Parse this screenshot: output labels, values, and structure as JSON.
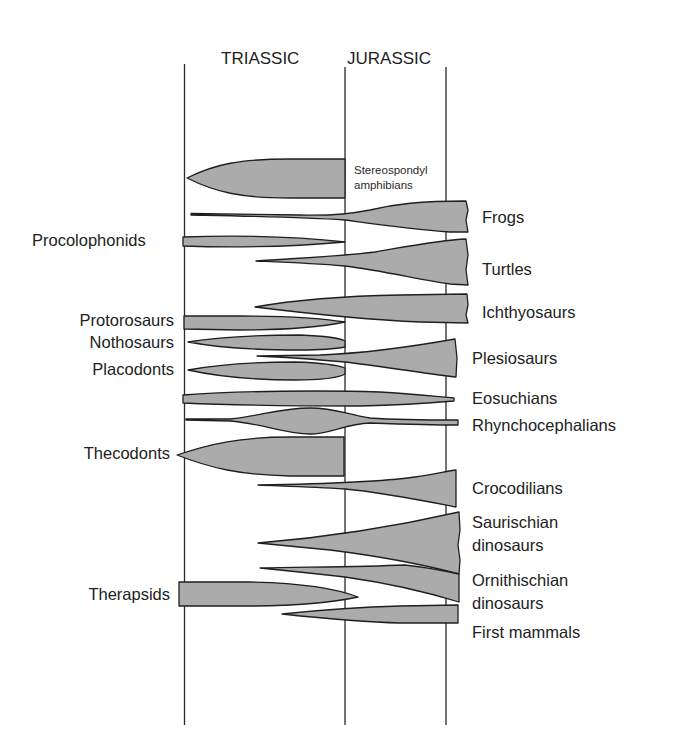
{
  "diagram": {
    "periods": [
      {
        "label": "TRIASSIC"
      },
      {
        "label": "JURASSIC"
      }
    ],
    "colors": {
      "fill": "#ababab",
      "outline": "#1f1f1f",
      "text": "#222222",
      "background": "#ffffff"
    },
    "groups": [
      {
        "name": "Stereospondyl",
        "name_line2": "amphibians",
        "side": "right",
        "range": "Triassic only (ends at Triassic/Jurassic boundary)"
      },
      {
        "name": "Frogs",
        "side": "right",
        "range": "Early Triassic (thin) expanding through Jurassic"
      },
      {
        "name": "Procolophonids",
        "side": "left",
        "range": "Triassic only"
      },
      {
        "name": "Turtles",
        "side": "right",
        "range": "Late Triassic expanding through Jurassic"
      },
      {
        "name": "Ichthyosaurs",
        "side": "right",
        "range": "Mid Triassic through Jurassic"
      },
      {
        "name": "Protorosaurs",
        "side": "left",
        "range": "Triassic only"
      },
      {
        "name": "Nothosaurs",
        "side": "left",
        "range": "Triassic only"
      },
      {
        "name": "Plesiosaurs",
        "side": "right",
        "range": "Mid Triassic expanding through Jurassic"
      },
      {
        "name": "Placodonts",
        "side": "left",
        "range": "Triassic only"
      },
      {
        "name": "Eosuchians",
        "side": "right",
        "range": "Throughout Triassic and Jurassic"
      },
      {
        "name": "Rhynchocephalians",
        "side": "right",
        "range": "Throughout, peak at Late Triassic"
      },
      {
        "name": "Thecodonts",
        "side": "left",
        "range": "Triassic only"
      },
      {
        "name": "Crocodilians",
        "side": "right",
        "range": "Mid Triassic expanding through Jurassic"
      },
      {
        "name": "Saurischian",
        "name_line2": "dinosaurs",
        "side": "right",
        "range": "Mid Triassic expanding through Jurassic"
      },
      {
        "name": "Ornithischian",
        "name_line2": "dinosaurs",
        "side": "right",
        "range": "Mid Triassic expanding through Jurassic"
      },
      {
        "name": "Therapsids",
        "side": "left",
        "range": "Triassic into earliest Jurassic"
      },
      {
        "name": "First mammals",
        "side": "right",
        "range": "Late Triassic through Jurassic"
      }
    ]
  }
}
